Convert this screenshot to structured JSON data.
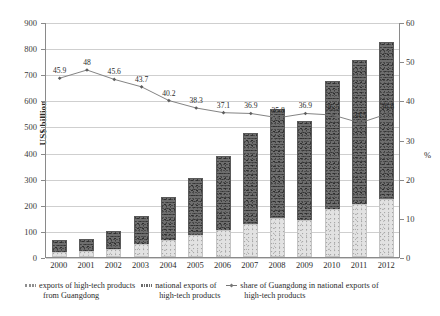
{
  "axes": {
    "y_label": "US$ billion",
    "y_ticks": [
      0,
      100,
      200,
      300,
      400,
      500,
      600,
      700,
      800,
      900
    ],
    "y2_label": "%",
    "y2_ticks": [
      0,
      10,
      20,
      30,
      40,
      50,
      60
    ]
  },
  "legend": {
    "items": [
      {
        "swatch": "bar-light-swatch",
        "line1": "exports of high-tech products",
        "line2": "from Guangdong"
      },
      {
        "swatch": "bar-dark-swatch",
        "line1": "national exports of",
        "line2": "high-tech products"
      },
      {
        "swatch": "line-swatch",
        "line1": "share of Guangdong in national exports of",
        "line2": "high-tech products"
      }
    ]
  },
  "chart_data": {
    "type": "bar",
    "title": "",
    "xlabel": "",
    "ylabel": "US$ billion",
    "y2label": "%",
    "ylim": [
      0,
      900
    ],
    "y2lim": [
      0,
      60
    ],
    "grid": true,
    "legend_position": "bottom",
    "categories": [
      "2000",
      "2001",
      "2002",
      "2003",
      "2004",
      "2005",
      "2006",
      "2007",
      "2008",
      "2009",
      "2010",
      "2011",
      "2012"
    ],
    "series": [
      {
        "name": "national exports of high-tech products",
        "type": "bar",
        "axis": "left",
        "values": [
          45,
          46,
          68,
          110,
          164,
          218,
          282,
          348,
          416,
          380,
          492,
          553,
          601
        ]
      },
      {
        "name": "exports of high-tech products from Guangdong",
        "type": "bar",
        "axis": "left",
        "values": [
          21,
          22,
          31,
          48,
          66,
          84,
          105,
          128,
          150,
          140,
          182,
          203,
          224
        ]
      },
      {
        "name": "share of Guangdong in national exports of high-tech products",
        "type": "line",
        "axis": "right",
        "values": [
          45.9,
          48,
          45.6,
          43.7,
          40.2,
          38.3,
          37.1,
          36.9,
          35.8,
          36.9,
          36.5,
          34.5,
          36.8
        ],
        "labels": [
          "45.9",
          "48",
          "45.6",
          "43.7",
          "40.2",
          "38.3",
          "37.1",
          "36.9",
          "35.8",
          "36.9",
          "36.5",
          "34.5",
          "36.8"
        ]
      }
    ],
    "bar_totals": [
      66,
      68,
      99,
      158,
      230,
      302,
      387,
      476,
      566,
      520,
      674,
      756,
      825
    ]
  }
}
